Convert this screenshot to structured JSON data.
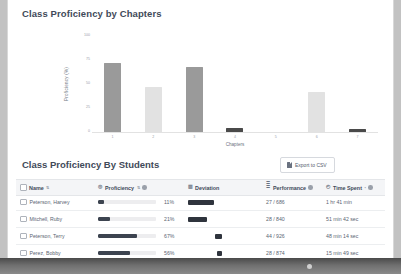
{
  "chart_card": {
    "title": "Class Proficiency by Chapters"
  },
  "chart_data": {
    "type": "bar",
    "title": "Class Proficiency by Chapters",
    "xlabel": "Chapters",
    "ylabel": "Proficiency (%)",
    "categories": [
      "1",
      "2",
      "3",
      "4",
      "5",
      "6",
      "7"
    ],
    "tick_labels": [
      "1",
      "2",
      "3",
      "4",
      "5",
      "6",
      "7"
    ],
    "values": [
      72,
      47,
      68,
      4,
      0,
      42,
      3
    ],
    "colors": [
      "#9a9a9a",
      "#e2e2e2",
      "#9a9a9a",
      "#4a4a4a",
      "#f2f2f2",
      "#e2e2e2",
      "#4a4a4a"
    ],
    "ylim": [
      0,
      100
    ],
    "yticks": [
      0,
      25,
      50,
      75,
      100
    ],
    "ytick_labels": [
      "0",
      "25",
      "50",
      "75",
      "100"
    ],
    "grid": false,
    "legend": "none"
  },
  "table_card": {
    "title": "Class Proficiency By Students",
    "export_label": "Export to CSV",
    "export_icon": "file-csv-icon",
    "columns": [
      {
        "label": "Name",
        "icon": "checkbox-icon",
        "sort": "⇅"
      },
      {
        "label": "Proficiency",
        "icon": "target-icon",
        "sort": "⇅",
        "info": "info-icon"
      },
      {
        "label": "Deviation",
        "icon": "chart-icon"
      },
      {
        "label": "Performance",
        "icon": "list-icon",
        "info": "info-icon"
      },
      {
        "label": "Time Spent",
        "icon": "clock-icon",
        "sort": "•",
        "info": "info-icon"
      }
    ],
    "rows": [
      {
        "name": "Peterson, Harvey",
        "proficiency_pct": "11%",
        "proficiency_value": 11,
        "deviation_offset": 0,
        "deviation_width": 26,
        "performance": "27 / 686",
        "time_spent": "1 hr 41 min"
      },
      {
        "name": "Mitchell, Ruby",
        "proficiency_pct": "21%",
        "proficiency_value": 21,
        "deviation_offset": 0,
        "deviation_width": 19,
        "performance": "28 / 840",
        "time_spent": "51 min 42 sec"
      },
      {
        "name": "Peterson, Terry",
        "proficiency_pct": "67%",
        "proficiency_value": 67,
        "deviation_offset": 27,
        "deviation_width": 7,
        "performance": "44 / 926",
        "time_spent": "48 min 14 sec"
      },
      {
        "name": "Perez, Bobby",
        "proficiency_pct": "56%",
        "proficiency_value": 56,
        "deviation_offset": 29,
        "deviation_width": 5,
        "performance": "28 / 874",
        "time_spent": "15 min 49 sec"
      }
    ]
  }
}
